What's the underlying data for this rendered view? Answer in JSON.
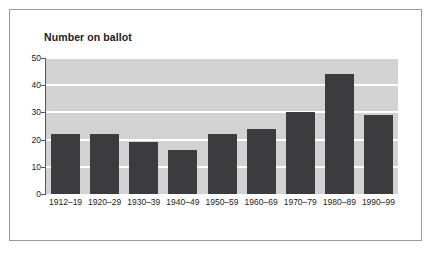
{
  "chart_data": {
    "type": "bar",
    "title": "Number on ballot",
    "xlabel": "",
    "ylabel": "",
    "categories": [
      "1912–19",
      "1920–29",
      "1930–39",
      "1940–49",
      "1950–59",
      "1960–69",
      "1970–79",
      "1980–89",
      "1990–99"
    ],
    "values": [
      22,
      22,
      19,
      16,
      22,
      24,
      30,
      44,
      29
    ],
    "yticks": [
      0,
      10,
      20,
      30,
      40,
      50
    ],
    "ytick_labels": [
      "0",
      "10",
      "20",
      "30",
      "40",
      "50"
    ],
    "ylim": [
      0,
      50
    ],
    "grid": true,
    "legend": "none",
    "colors": {
      "bar": "#3c3c3e",
      "plot_background": "#d2d2d2",
      "gridline": "#ffffff",
      "axis": "#55555a",
      "text": "#1c1c1c",
      "frame": "#9a9a9a",
      "page_background": "#ffffff"
    }
  }
}
